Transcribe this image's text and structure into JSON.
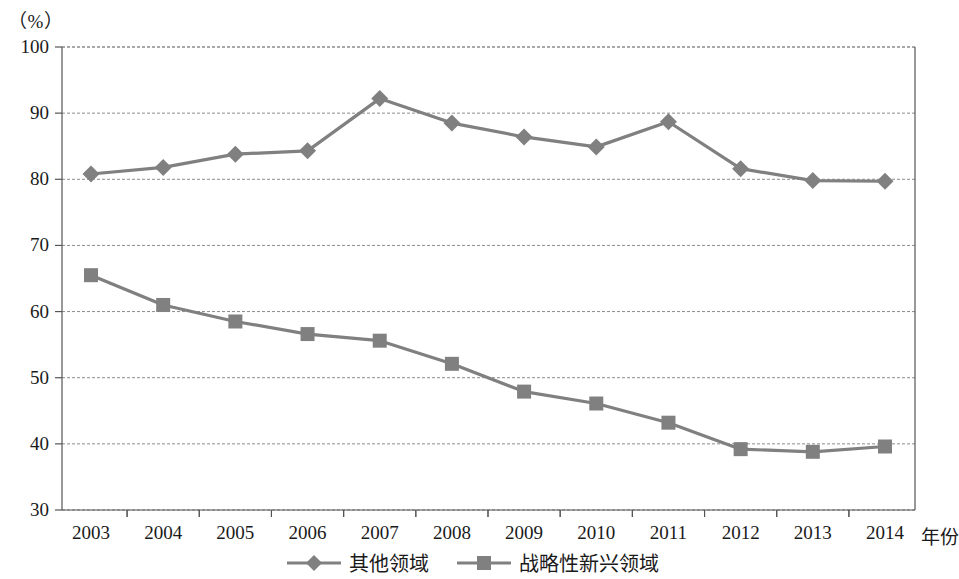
{
  "chart_data": {
    "type": "line",
    "title": "",
    "subtitle": "",
    "unit_label": "（%）",
    "xlabel": "年份",
    "ylabel": "",
    "categories": [
      "2003",
      "2004",
      "2005",
      "2006",
      "2007",
      "2008",
      "2009",
      "2010",
      "2011",
      "2012",
      "2013",
      "2014"
    ],
    "series": [
      {
        "name": "其他领域",
        "marker": "diamond",
        "color": "#808080",
        "values": [
          80.8,
          81.8,
          83.8,
          84.3,
          92.2,
          88.5,
          86.4,
          84.9,
          88.7,
          81.6,
          79.8,
          79.7
        ]
      },
      {
        "name": "战略性新兴领域",
        "marker": "square",
        "color": "#808080",
        "values": [
          65.5,
          61.0,
          58.5,
          56.6,
          55.6,
          52.1,
          47.9,
          46.1,
          43.2,
          39.2,
          38.8,
          39.6
        ]
      }
    ],
    "ylim": [
      30,
      100
    ],
    "yticks": [
      100,
      90,
      80,
      70,
      60,
      50,
      40,
      30
    ],
    "grid": true,
    "grid_style": "dashed",
    "legend_position": "bottom"
  },
  "colors": {
    "series": "#808080",
    "axis": "#555555",
    "grid": "#8c8c8c",
    "text": "#1a1a1a"
  }
}
